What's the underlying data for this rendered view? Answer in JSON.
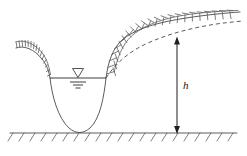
{
  "figure": {
    "type": "engineering-cross-section",
    "width": 247,
    "height": 156,
    "background_color": "#ffffff"
  },
  "labels": {
    "depth_dimension": "h"
  },
  "colors": {
    "line": "#4a4a4a",
    "hatch": "#5a5a5a",
    "dimension": "#1f1f1f",
    "water_table": "#3f3f3f",
    "background": "#ffffff"
  },
  "elements": {
    "bedrock_line": {
      "name": "bedrock-datum-line",
      "y": 133,
      "x_start": 10,
      "x_end": 237,
      "hatch_count": 20,
      "hatch_length": 9,
      "hatch_angle_deg": 55
    },
    "ground_profile": {
      "name": "ground-surface-profile",
      "description": "Parabolic depression flanked by a low left crest and a rising right bank"
    },
    "water_surface": {
      "name": "water-surface-line",
      "y": 78,
      "x_start": 50,
      "x_end": 106
    },
    "water_table_symbol": {
      "name": "water-table-symbol",
      "x": 78,
      "y": 72,
      "triangle_width": 11,
      "triangle_height": 8,
      "tick_widths": [
        16,
        10,
        5
      ]
    },
    "left_slope_hatching": {
      "name": "left-slope-hatch-marks",
      "count": 13,
      "tick_length": 6
    },
    "right_slope_hatching": {
      "name": "right-slope-hatch-marks",
      "count": 17,
      "tick_length": 9
    },
    "drawdown_curve": {
      "name": "drawdown-curve-dashed",
      "style": "dashed",
      "dash_pattern": "4 3"
    },
    "depth_dimension": {
      "name": "depth-dimension-arrow",
      "x": 177,
      "y_top": 38,
      "y_bottom": 133,
      "double_headed": true,
      "label": "h",
      "label_x": 183,
      "label_y": 89
    }
  }
}
